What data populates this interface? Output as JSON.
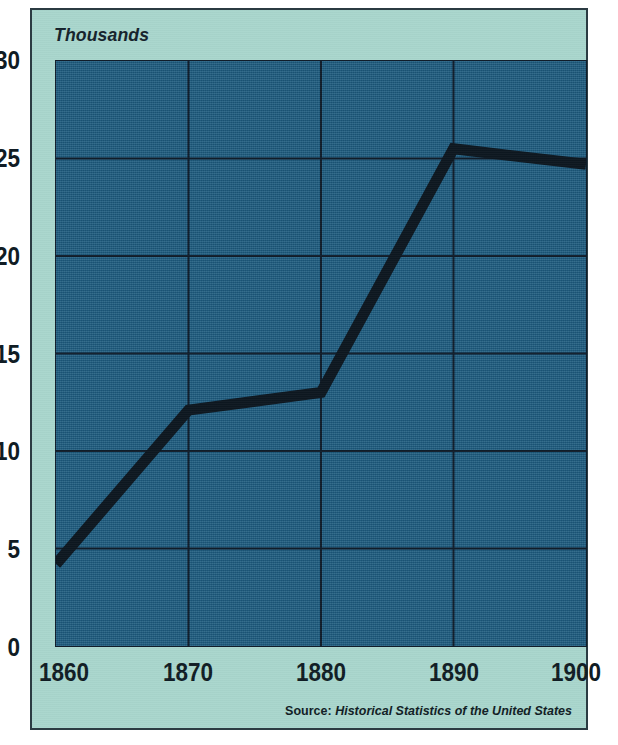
{
  "figure": {
    "cut_off_title_fragment": "·",
    "unit_label": "Thousands",
    "source_label": "Source:",
    "source_title": "Historical Statistics of the United States"
  },
  "colors": {
    "board_background": "#a9d6cd",
    "plot_fill": "#1d5c80",
    "frame_border": "#2b3b42",
    "gridline": "#101d2a",
    "series_line": "#0d1720",
    "tick_text": "#101c24"
  },
  "chart_data": {
    "type": "line",
    "title": "",
    "xlabel": "",
    "ylabel": "Thousands",
    "x": [
      1860,
      1870,
      1880,
      1890,
      1900
    ],
    "values": [
      4.2,
      12.1,
      13.0,
      25.5,
      24.7
    ],
    "series": [
      {
        "name": "Thousands",
        "values": [
          4.2,
          12.1,
          13.0,
          25.5,
          24.7
        ]
      }
    ],
    "xlim": [
      1860,
      1900
    ],
    "ylim": [
      0,
      30
    ],
    "yticks": [
      0,
      5,
      10,
      15,
      20,
      25,
      30
    ],
    "ytick_labels": [
      "0",
      "5",
      "10",
      "15",
      "20",
      "25",
      "30"
    ],
    "xticks": [
      1860,
      1870,
      1880,
      1890,
      1900
    ],
    "xtick_labels": [
      "1860",
      "1870",
      "1880",
      "1890",
      "1900"
    ],
    "gridlines_horizontal_at": [
      5,
      10,
      15,
      20,
      25
    ],
    "gridlines_vertical_at": [
      1870,
      1880,
      1890
    ],
    "grid": true,
    "legend": "none",
    "annotations": []
  }
}
